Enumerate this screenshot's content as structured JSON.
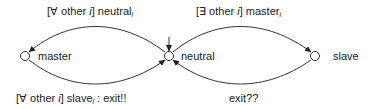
{
  "diagram": {
    "type": "state-machine",
    "states": [
      {
        "id": "master",
        "label": "master"
      },
      {
        "id": "neutral",
        "label": "neutral",
        "initial": true
      },
      {
        "id": "slave",
        "label": "slave"
      }
    ],
    "transitions": [
      {
        "from": "neutral",
        "to": "master",
        "guard_prefix": "[∀ other ",
        "guard_var": "i",
        "guard_suffix": "] neutral",
        "guard_sub": "i"
      },
      {
        "from": "neutral",
        "to": "slave",
        "guard_prefix": "[∃ other ",
        "guard_var": "i",
        "guard_suffix": "] master",
        "guard_sub": "i"
      },
      {
        "from": "master",
        "to": "neutral",
        "guard_prefix": "[∀ other ",
        "guard_var": "i",
        "guard_suffix": "] slave",
        "guard_sub": "i",
        "action": " :  exit!!"
      },
      {
        "from": "slave",
        "to": "neutral",
        "label": "exit??"
      }
    ]
  },
  "colors": {
    "stroke": "#333333",
    "text": "#222222"
  }
}
